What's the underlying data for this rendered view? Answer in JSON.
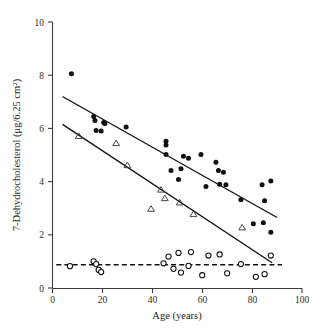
{
  "chart_data": {
    "type": "scatter",
    "title": "",
    "xlabel": "Age (years)",
    "ylabel": "7-Dehydrocholesterol (μg/6.25 cm",
    "ylabel_sup": "2",
    "ylabel_close": ")",
    "xlim": [
      0,
      100
    ],
    "ylim": [
      0,
      10
    ],
    "xticks": [
      0,
      20,
      40,
      60,
      80,
      100
    ],
    "yticks": [
      0,
      2,
      4,
      6,
      8,
      10
    ],
    "grid": false,
    "legend": "none",
    "series": [
      {
        "name": "filled-circles",
        "marker": "filled-circle",
        "color": "#101010",
        "points": [
          [
            7.6,
            8.05
          ],
          [
            16.5,
            6.45
          ],
          [
            17.0,
            6.3
          ],
          [
            17.5,
            5.92
          ],
          [
            19.5,
            5.9
          ],
          [
            20.5,
            6.22
          ],
          [
            21.0,
            6.18
          ],
          [
            29.5,
            6.05
          ],
          [
            45.5,
            5.52
          ],
          [
            45.5,
            5.38
          ],
          [
            45.5,
            5.02
          ],
          [
            47.5,
            4.42
          ],
          [
            50.5,
            4.08
          ],
          [
            51.5,
            4.48
          ],
          [
            52.5,
            4.95
          ],
          [
            54.5,
            4.88
          ],
          [
            59.5,
            5.02
          ],
          [
            61.5,
            3.82
          ],
          [
            65.5,
            4.73
          ],
          [
            66.5,
            4.42
          ],
          [
            67.0,
            3.9
          ],
          [
            68.5,
            4.35
          ],
          [
            69.5,
            3.88
          ],
          [
            75.5,
            3.32
          ],
          [
            80.5,
            2.42
          ],
          [
            84.0,
            3.88
          ],
          [
            84.5,
            2.45
          ],
          [
            85.0,
            3.28
          ],
          [
            87.5,
            4.02
          ],
          [
            87.5,
            2.1
          ]
        ]
      },
      {
        "name": "open-triangles",
        "marker": "open-triangle",
        "color": "#3d3d3d",
        "points": [
          [
            10.5,
            5.72
          ],
          [
            25.5,
            5.45
          ],
          [
            30.0,
            4.62
          ],
          [
            39.5,
            2.98
          ],
          [
            43.5,
            3.7
          ],
          [
            45.0,
            3.38
          ],
          [
            51.0,
            3.22
          ],
          [
            56.5,
            2.78
          ],
          [
            76.0,
            2.28
          ]
        ]
      },
      {
        "name": "open-circles",
        "marker": "open-circle",
        "color": "#111111",
        "points": [
          [
            7.0,
            0.82
          ],
          [
            16.5,
            1.0
          ],
          [
            17.5,
            0.9
          ],
          [
            18.5,
            0.68
          ],
          [
            19.5,
            0.6
          ],
          [
            44.5,
            0.93
          ],
          [
            46.5,
            1.18
          ],
          [
            48.5,
            0.72
          ],
          [
            50.5,
            1.32
          ],
          [
            51.5,
            0.58
          ],
          [
            54.5,
            0.83
          ],
          [
            55.5,
            1.35
          ],
          [
            60.0,
            0.48
          ],
          [
            62.5,
            1.22
          ],
          [
            67.0,
            1.26
          ],
          [
            70.0,
            0.55
          ],
          [
            75.5,
            0.9
          ],
          [
            81.5,
            0.42
          ],
          [
            85.0,
            0.52
          ],
          [
            87.5,
            1.22
          ]
        ]
      }
    ],
    "fit_lines": [
      {
        "name": "upper-regression-line",
        "x": [
          4.0,
          90.0
        ],
        "y": [
          7.2,
          2.65
        ],
        "style": "solid"
      },
      {
        "name": "lower-regression-line",
        "x": [
          4.0,
          88.0
        ],
        "y": [
          6.15,
          0.95
        ],
        "style": "solid"
      }
    ],
    "threshold_line": {
      "name": "detection-threshold",
      "y": 0.87,
      "x": [
        1.5,
        92.0
      ],
      "style": "dashed"
    }
  }
}
